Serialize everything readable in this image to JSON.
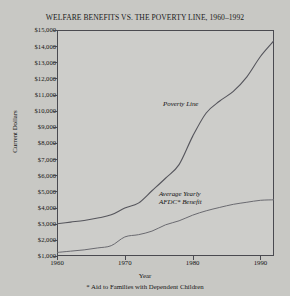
{
  "chart_data": {
    "type": "line",
    "title": "WELFARE BENEFITS VS. THE POVERTY LINE, 1960–1992",
    "xlabel": "Year",
    "ylabel": "Current Dollars",
    "footnote": "* Aid to Families with Dependent Children",
    "xlim": [
      1960,
      1992
    ],
    "ylim": [
      1000,
      15000
    ],
    "xticks": [
      1960,
      1970,
      1980,
      1990
    ],
    "xtick_labels": [
      "1960",
      "1970",
      "1980",
      "1990"
    ],
    "yticks": [
      1000,
      2000,
      3000,
      4000,
      5000,
      6000,
      7000,
      8000,
      9000,
      10000,
      11000,
      12000,
      13000,
      14000,
      15000
    ],
    "ytick_labels": [
      "$1,000",
      "$2,000",
      "$3,000",
      "$4,000",
      "$5,000",
      "$6,000",
      "$7,000",
      "$8,000",
      "$9,000",
      "$10,000",
      "$11,000",
      "$12,000",
      "$13,000",
      "$14,000",
      "$15,000"
    ],
    "grid": false,
    "legend": "inline-annotations",
    "line_color": "#55555c",
    "series": [
      {
        "name": "Poverty Line",
        "annotation": "Poverty Line",
        "x": [
          1960,
          1962,
          1964,
          1966,
          1968,
          1970,
          1972,
          1974,
          1976,
          1978,
          1980,
          1982,
          1984,
          1986,
          1988,
          1990,
          1992
        ],
        "values": [
          3000,
          3100,
          3200,
          3350,
          3550,
          3970,
          4275,
          5040,
          5815,
          6660,
          8410,
          9860,
          10600,
          11200,
          12100,
          13360,
          14340
        ]
      },
      {
        "name": "Average Yearly AFDC Benefit",
        "annotation": "Average Yearly\nAFDC* Benefit",
        "annotation_line1": "Average Yearly",
        "annotation_line2": "AFDC* Benefit",
        "x": [
          1960,
          1962,
          1964,
          1966,
          1968,
          1970,
          1972,
          1974,
          1976,
          1978,
          1980,
          1982,
          1984,
          1986,
          1988,
          1990,
          1992
        ],
        "values": [
          1220,
          1300,
          1380,
          1500,
          1640,
          2180,
          2320,
          2540,
          2930,
          3180,
          3530,
          3800,
          4010,
          4200,
          4330,
          4450,
          4480
        ]
      }
    ]
  },
  "annotations": {
    "poverty_line": "Poverty Line",
    "afdc_line1": "Average Yearly",
    "afdc_line2": "AFDC* Benefit"
  }
}
